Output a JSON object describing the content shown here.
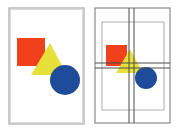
{
  "diagram": {
    "colors": {
      "background": "#ffffff",
      "frame": "#9a9a9a",
      "grid": "#5a5a5a",
      "red": "#f0401c",
      "yellow": "#e8e03a",
      "blue": "#1f4c9a"
    },
    "panels": [
      {
        "name": "composition",
        "frame": {
          "x": 9,
          "y": 8,
          "w": 75,
          "h": 116
        },
        "shapes": {
          "square": {
            "x": 17,
            "y": 38,
            "w": 28,
            "h": 28
          },
          "triangle": {
            "points": "50,43 31,75 67,75"
          },
          "circle": {
            "cx": 65,
            "cy": 80,
            "r": 15
          }
        }
      },
      {
        "name": "grid-overlay",
        "frame": {
          "x": 95,
          "y": 8,
          "w": 75,
          "h": 115
        },
        "margin": {
          "x": 102,
          "y": 22,
          "w": 62,
          "h": 88
        },
        "guides_v": [
          129,
          134
        ],
        "guides_h": [
          63,
          68
        ],
        "shapes": {
          "square": {
            "x": 106,
            "y": 45,
            "w": 21,
            "h": 21
          },
          "triangle": {
            "points": "130,49 116,73 143,73"
          },
          "circle": {
            "cx": 146,
            "cy": 78,
            "r": 11
          }
        }
      }
    ]
  }
}
